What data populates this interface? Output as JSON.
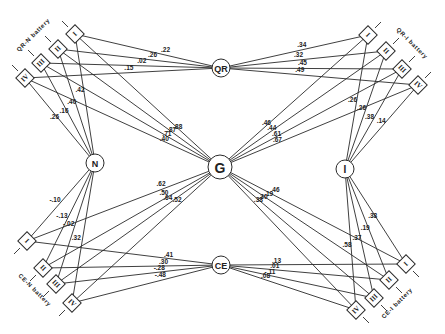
{
  "factors": {
    "QR": "QR",
    "CE": "CE",
    "G": "G",
    "N": "N",
    "I": "I"
  },
  "batteries": {
    "qr_n": {
      "label": "QR-N battery",
      "boxes": [
        "I",
        "II",
        "III",
        "IV"
      ]
    },
    "qr_i": {
      "label": "QR-I battery",
      "boxes": [
        "I",
        "II",
        "III",
        "IV"
      ]
    },
    "ce_n": {
      "label": "CE-N battery",
      "boxes": [
        "I",
        "II",
        "III",
        "IV"
      ]
    },
    "ce_i": {
      "label": "CE-I battery",
      "boxes": [
        "I",
        "II",
        "III",
        "IV"
      ]
    }
  },
  "loadings": {
    "QR_to_qr_n": [
      ".22",
      ".26",
      ".02",
      ".15"
    ],
    "QR_to_qr_i": [
      ".34",
      ".32",
      ".45",
      ".49"
    ],
    "CE_to_ce_n": [
      ".41",
      ".30",
      "-.28",
      "-.48"
    ],
    "CE_to_ce_i": [
      ".13",
      ".01",
      "-.11",
      ".08"
    ],
    "G_to_qr_n": [
      ".88",
      ".87",
      ".71",
      ".40"
    ],
    "G_to_qr_i": [
      ".46",
      ".44",
      ".61",
      ".67"
    ],
    "G_to_ce_n": [
      ".62",
      ".50",
      ".64",
      ".52"
    ],
    "G_to_ce_i": [
      ".46",
      ".19",
      ".30",
      ".38"
    ],
    "N_to_qr_n": [
      ".42",
      ".40",
      ".16",
      ".26"
    ],
    "N_to_ce_n": [
      "-.10",
      "-.13",
      "-.02",
      ".32"
    ],
    "I_to_qr_i": [
      ".26",
      ".26",
      ".38",
      ".14"
    ],
    "I_to_ce_i": [
      ".38",
      ".19",
      ".37",
      ".58"
    ]
  }
}
